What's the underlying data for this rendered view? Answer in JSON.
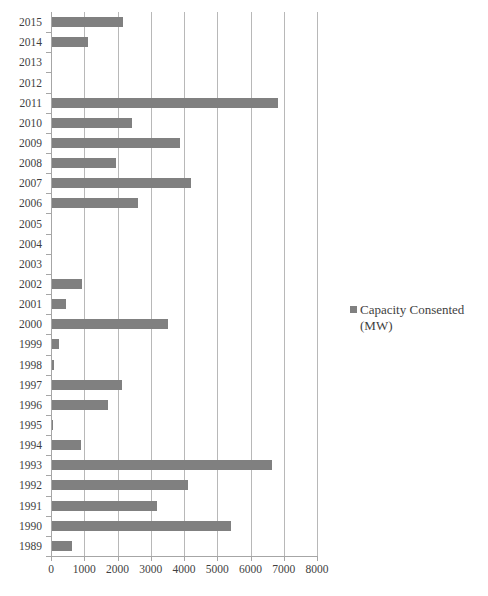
{
  "chart_data": {
    "type": "bar",
    "orientation": "horizontal",
    "title": "",
    "xlabel": "",
    "ylabel": "",
    "xlim": [
      0,
      8000
    ],
    "ylim": null,
    "grid": true,
    "legend_position": "right",
    "series_name": "Capacity Consented (MW)",
    "bar_color": "#808080",
    "x_ticks": [
      0,
      1000,
      2000,
      3000,
      4000,
      5000,
      6000,
      7000,
      8000
    ],
    "x_tick_labels": [
      "0",
      "1000",
      "2000",
      "3000",
      "4000",
      "5000",
      "6000",
      "7000",
      "8000"
    ],
    "categories": [
      "2015",
      "2014",
      "2013",
      "2012",
      "2011",
      "2010",
      "2009",
      "2008",
      "2007",
      "2006",
      "2005",
      "2004",
      "2003",
      "2002",
      "2001",
      "2000",
      "1999",
      "1998",
      "1997",
      "1996",
      "1995",
      "1994",
      "1993",
      "1992",
      "1991",
      "1990",
      "1989"
    ],
    "values": [
      2160,
      1110,
      0,
      0,
      6830,
      2440,
      3880,
      1960,
      4220,
      2630,
      0,
      0,
      0,
      930,
      450,
      3520,
      240,
      90,
      2140,
      1700,
      50,
      900,
      6650,
      4120,
      3180,
      5410,
      640
    ]
  },
  "legend": {
    "marker_name": "legend-color-swatch",
    "label": "Capacity Consented (MW)"
  }
}
